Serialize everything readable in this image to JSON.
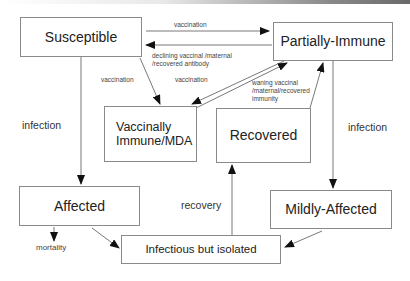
{
  "diagram": {
    "type": "state-transition",
    "nodes": {
      "susceptible": "Susceptible",
      "partially_immune": "Partially-Immune",
      "vaccinally_immune_line1": "Vaccinally",
      "vaccinally_immune_line2": "Immune/MDA",
      "recovered": "Recovered",
      "affected": "Affected",
      "mildly_affected": "Mildly-Affected",
      "infectious_isolated": "Infectious but isolated"
    },
    "edges": {
      "vaccination_top": "vaccination",
      "declining_line1": "declining vaccinal /maternal",
      "declining_line2": "/recovered antibody",
      "vaccination_left": "vaccination",
      "vaccination_mid": "vaccination",
      "waning_line1": "waning vaccinal",
      "waning_line2": "/maternal/recovered",
      "waning_line3": "immunity",
      "infection_left": "infection",
      "infection_right": "infection",
      "recovery": "recovery",
      "mortality": "mortality"
    },
    "colors": {
      "line": "#555555",
      "box_border": "#8a8a8a",
      "background": "#ffffff"
    }
  }
}
